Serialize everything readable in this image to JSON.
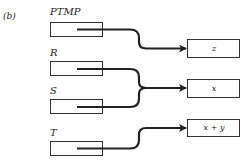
{
  "figure": {
    "panel_label": "(b)",
    "sources": [
      {
        "label": "PTMP"
      },
      {
        "label": "R"
      },
      {
        "label": "S"
      },
      {
        "label": "T"
      }
    ],
    "targets": [
      {
        "label": "z"
      },
      {
        "label": "x"
      },
      {
        "label": "x + y"
      }
    ],
    "connections": [
      {
        "from": "PTMP",
        "to": "z"
      },
      {
        "from": "R",
        "to": "x"
      },
      {
        "from": "S",
        "to": "x"
      },
      {
        "from": "T",
        "to": "x + y"
      }
    ],
    "colors": {
      "line": "#222222",
      "box_border": "#333333"
    }
  }
}
